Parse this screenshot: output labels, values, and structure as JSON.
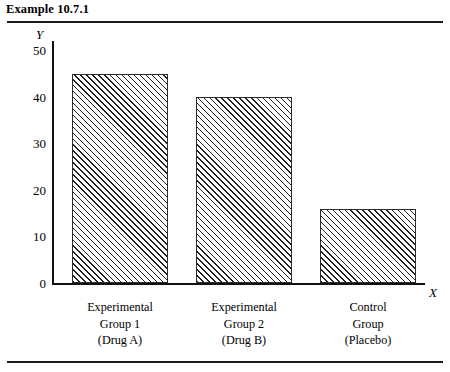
{
  "figure": {
    "title": "Example 10.7.1"
  },
  "chart_data": {
    "type": "bar",
    "title": "Example 10.7.1",
    "xlabel": "X",
    "ylabel": "Y",
    "categories": [
      "Experimental Group 1 (Drug A)",
      "Experimental Group 2 (Drug B)",
      "Control Group (Placebo)"
    ],
    "category_lines": [
      [
        "Experimental",
        "Group 1",
        "(Drug A)"
      ],
      [
        "Experimental",
        "Group 2",
        "(Drug B)"
      ],
      [
        "Control",
        "Group",
        "(Placebo)"
      ]
    ],
    "values": [
      45,
      40,
      16
    ],
    "ylim": [
      0,
      52
    ],
    "yticks": [
      0,
      10,
      20,
      30,
      40,
      50
    ],
    "ytick_labels": [
      "0",
      "10",
      "20",
      "30",
      "40",
      "50"
    ],
    "grid": false,
    "legend": false,
    "bar_fill": "diagonal-hatch",
    "bar_color": "#1f1f1f",
    "axis_color": "#111111"
  }
}
